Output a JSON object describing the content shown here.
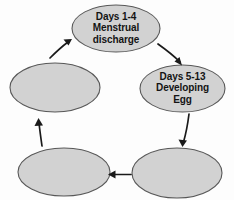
{
  "diagram": {
    "type": "cycle",
    "background_color": "#fdfdfd",
    "node_fill_color": "#d2d2d2",
    "node_stroke_color": "#585858",
    "arrow_color": "#1a1a1a",
    "text_color": "#141414",
    "nodes": [
      {
        "id": "node-menstrual-discharge",
        "position": "top",
        "labelled": true,
        "lines": [
          "Days 1-4",
          "Menstrual",
          "discharge"
        ]
      },
      {
        "id": "node-developing-egg",
        "position": "right",
        "labelled": true,
        "lines": [
          "Days 5-13",
          "Developing",
          "Egg"
        ]
      },
      {
        "id": "node-blank-bottom-right",
        "position": "bottom-right",
        "labelled": false,
        "lines": []
      },
      {
        "id": "node-blank-bottom-left",
        "position": "bottom-left",
        "labelled": false,
        "lines": []
      },
      {
        "id": "node-blank-left",
        "position": "left",
        "labelled": false,
        "lines": []
      }
    ],
    "arrows": [
      {
        "id": "arrow-top-to-right",
        "from": "node-menstrual-discharge",
        "to": "node-developing-egg"
      },
      {
        "id": "arrow-right-to-bottom-right",
        "from": "node-developing-egg",
        "to": "node-blank-bottom-right"
      },
      {
        "id": "arrow-bottom-right-to-bottom-left",
        "from": "node-blank-bottom-right",
        "to": "node-blank-bottom-left"
      },
      {
        "id": "arrow-bottom-left-to-left",
        "from": "node-blank-bottom-left",
        "to": "node-blank-left"
      },
      {
        "id": "arrow-left-to-top",
        "from": "node-blank-left",
        "to": "node-menstrual-discharge"
      }
    ]
  }
}
